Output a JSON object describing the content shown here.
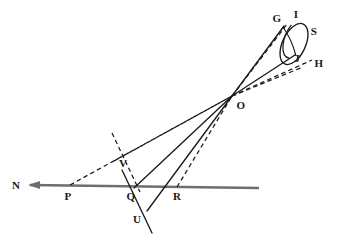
{
  "figure": {
    "stroke_color": "#1a1a1a",
    "axis_color": "#6e6e6e",
    "background": "#ffffff"
  },
  "labels": [
    {
      "id": "label-N",
      "text": "N",
      "x": 16,
      "y": 185
    },
    {
      "id": "label-P",
      "text": "P",
      "x": 68,
      "y": 196
    },
    {
      "id": "label-Q",
      "text": "Q",
      "x": 131,
      "y": 196
    },
    {
      "id": "label-R",
      "text": "R",
      "x": 177,
      "y": 196
    },
    {
      "id": "label-U",
      "text": "U",
      "x": 137,
      "y": 219
    },
    {
      "id": "label-V",
      "text": "V",
      "x": 123,
      "y": 163
    },
    {
      "id": "label-O",
      "text": "O",
      "x": 241,
      "y": 105
    },
    {
      "id": "label-G",
      "text": "G",
      "x": 277,
      "y": 18
    },
    {
      "id": "label-I",
      "text": "I",
      "x": 296,
      "y": 14
    },
    {
      "id": "label-S",
      "text": "S",
      "x": 314,
      "y": 31
    },
    {
      "id": "label-J",
      "text": "J",
      "x": 297,
      "y": 58
    },
    {
      "id": "label-H",
      "text": "H",
      "x": 319,
      "y": 63
    }
  ],
  "points": {
    "N": {
      "x": 30,
      "y": 185
    },
    "P": {
      "x": 68,
      "y": 187
    },
    "Q": {
      "x": 134,
      "y": 188
    },
    "R": {
      "x": 176,
      "y": 188
    },
    "U": {
      "x": 147,
      "y": 211
    },
    "V": {
      "x": 124,
      "y": 156
    },
    "O": {
      "x": 232,
      "y": 96
    },
    "G": {
      "x": 283,
      "y": 27
    },
    "H": {
      "x": 310,
      "y": 62
    },
    "J": {
      "x": 292,
      "y": 54
    },
    "S": {
      "x": 306,
      "y": 32
    },
    "I": {
      "x": 296,
      "y": 24
    }
  },
  "axis_line": {
    "name": "line-N-R",
    "from": {
      "x": 30,
      "y": 185
    },
    "to": {
      "x": 259,
      "y": 188
    },
    "arrow_at": "N"
  },
  "solid_segments": [
    {
      "name": "segment-O-Q",
      "from": {
        "x": 232,
        "y": 96
      },
      "to": {
        "x": 134,
        "y": 188
      }
    },
    {
      "name": "segment-O-U",
      "from": {
        "x": 232,
        "y": 96
      },
      "to": {
        "x": 147,
        "y": 211
      }
    },
    {
      "name": "segment-Q-U-extended",
      "from": {
        "x": 122,
        "y": 170
      },
      "to": {
        "x": 152,
        "y": 233
      }
    },
    {
      "name": "segment-O-G",
      "from": {
        "x": 232,
        "y": 96
      },
      "to": {
        "x": 283,
        "y": 27
      }
    },
    {
      "name": "segment-O-J",
      "from": {
        "x": 232,
        "y": 96
      },
      "to": {
        "x": 295,
        "y": 55
      }
    }
  ],
  "dashed_segments": [
    {
      "name": "dashed-P-O",
      "from": {
        "x": 70,
        "y": 185
      },
      "to": {
        "x": 232,
        "y": 96
      }
    },
    {
      "name": "dashed-V-O",
      "from": {
        "x": 114,
        "y": 161
      },
      "to": {
        "x": 232,
        "y": 96
      }
    },
    {
      "name": "dashed-R-O",
      "from": {
        "x": 177,
        "y": 187
      },
      "to": {
        "x": 232,
        "y": 96
      }
    },
    {
      "name": "dashed-V-normal",
      "from": {
        "x": 112,
        "y": 133
      },
      "to": {
        "x": 140,
        "y": 192
      }
    },
    {
      "name": "dashed-cone-upper",
      "from": {
        "x": 232,
        "y": 96
      },
      "to": {
        "x": 288,
        "y": 24
      }
    },
    {
      "name": "dashed-cone-lower",
      "from": {
        "x": 232,
        "y": 96
      },
      "to": {
        "x": 311,
        "y": 61
      }
    },
    {
      "name": "dashed-cone-inner",
      "from": {
        "x": 232,
        "y": 96
      },
      "to": {
        "x": 305,
        "y": 66
      }
    }
  ],
  "ellipse": {
    "name": "ellipse-disc-GISH",
    "cx": 294,
    "cy": 44,
    "rx": 11,
    "ry": 22,
    "rotation_deg": 25
  },
  "inner_ellipse": {
    "name": "ellipse-inner-arc",
    "cx": 291,
    "cy": 43,
    "rx": 7,
    "ry": 20,
    "rotation_deg": 25
  }
}
